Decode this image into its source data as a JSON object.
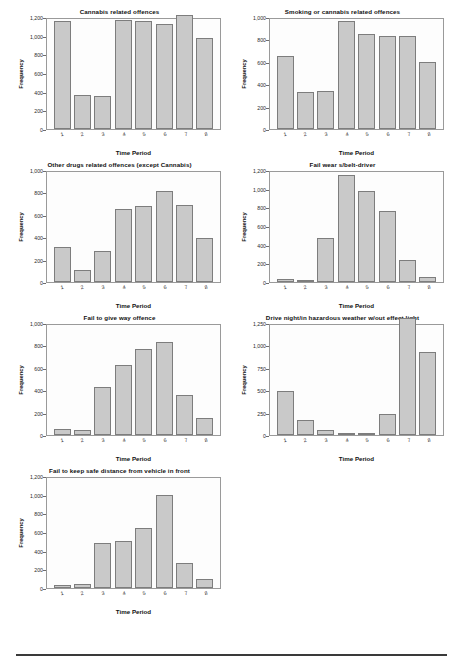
{
  "page": {
    "axis_x_label": "Time Period",
    "axis_y_label": "Frequency",
    "footer_rule_color": "#3a3a3a",
    "bar_fill": "#c9c9c9",
    "bar_stroke": "#7d7d7d"
  },
  "chart_data": [
    {
      "type": "bar",
      "title": "Cannabis related offences",
      "xlabel": "Time Period",
      "ylabel": "Frequency",
      "categories": [
        "1",
        "2",
        "3",
        "4",
        "5",
        "6",
        "7",
        "8"
      ],
      "values": [
        1180,
        370,
        362,
        1192,
        1180,
        1150,
        1240,
        990
      ],
      "ylim": [
        0,
        1200
      ],
      "yticks": [
        0,
        200,
        400,
        600,
        800,
        1000,
        1200
      ],
      "ytick_labels": [
        "0",
        "200",
        "400",
        "600",
        "800",
        "1,000",
        "1,200"
      ],
      "grid": false,
      "legend": "none"
    },
    {
      "type": "bar",
      "title": "Smoking or cannabis related offences",
      "xlabel": "Time Period",
      "ylabel": "Frequency",
      "categories": [
        "1",
        "2",
        "3",
        "4",
        "5",
        "6",
        "7",
        "8"
      ],
      "values": [
        665,
        340,
        345,
        985,
        862,
        845,
        845,
        612
      ],
      "ylim": [
        0,
        1000
      ],
      "yticks": [
        0,
        200,
        400,
        600,
        800,
        1000
      ],
      "ytick_labels": [
        "0",
        "200",
        "400",
        "600",
        "800",
        "1,000"
      ],
      "grid": false,
      "legend": "none"
    },
    {
      "type": "bar",
      "title": "Other drugs related offences (except Cannabis)",
      "xlabel": "Time Period",
      "ylabel": "Frequency",
      "categories": [
        "1",
        "2",
        "3",
        "4",
        "5",
        "6",
        "7",
        "8"
      ],
      "values": [
        320,
        105,
        282,
        665,
        692,
        828,
        700,
        398
      ],
      "ylim": [
        0,
        1000
      ],
      "yticks": [
        0,
        200,
        400,
        600,
        800,
        1000
      ],
      "ytick_labels": [
        "0",
        "200",
        "400",
        "600",
        "800",
        "1,000"
      ],
      "grid": false,
      "legend": "none"
    },
    {
      "type": "bar",
      "title": "Fail wear s/belt-driver",
      "xlabel": "Time Period",
      "ylabel": "Frequency",
      "categories": [
        "1",
        "2",
        "3",
        "4",
        "5",
        "6",
        "7",
        "8"
      ],
      "values": [
        38,
        25,
        478,
        1165,
        998,
        778,
        240,
        50
      ],
      "ylim": [
        0,
        1200
      ],
      "yticks": [
        0,
        200,
        400,
        600,
        800,
        1000,
        1200
      ],
      "ytick_labels": [
        "0",
        "200",
        "400",
        "600",
        "800",
        "1,000",
        "1,200"
      ],
      "grid": false,
      "legend": "none"
    },
    {
      "type": "bar",
      "title": "Fail to give way offence",
      "xlabel": "Time Period",
      "ylabel": "Frequency",
      "categories": [
        "1",
        "2",
        "3",
        "4",
        "5",
        "6",
        "7",
        "8"
      ],
      "values": [
        58,
        50,
        435,
        632,
        785,
        845,
        362,
        152
      ],
      "ylim": [
        0,
        1000
      ],
      "yticks": [
        0,
        200,
        400,
        600,
        800,
        1000
      ],
      "ytick_labels": [
        "0",
        "200",
        "400",
        "600",
        "800",
        "1,000"
      ],
      "grid": false,
      "legend": "none"
    },
    {
      "type": "bar",
      "title": "Drive night/in hazardous weather w/out effect light",
      "xlabel": "Time Period",
      "ylabel": "Frequency",
      "categories": [
        "1",
        "2",
        "3",
        "4",
        "5",
        "6",
        "7",
        "8"
      ],
      "values": [
        505,
        168,
        55,
        28,
        25,
        243,
        1335,
        938
      ],
      "ylim": [
        0,
        1250
      ],
      "yticks": [
        0,
        250,
        500,
        750,
        1000,
        1250
      ],
      "ytick_labels": [
        "0",
        "250",
        "500",
        "750",
        "1,000",
        "1,250"
      ],
      "grid": false,
      "legend": "none"
    },
    {
      "type": "bar",
      "title": "Fail to keep safe distance from vehicle in front",
      "xlabel": "Time Period",
      "ylabel": "Frequency",
      "categories": [
        "1",
        "2",
        "3",
        "4",
        "5",
        "6",
        "7",
        "8"
      ],
      "values": [
        28,
        42,
        492,
        512,
        650,
        1012,
        268,
        98
      ],
      "ylim": [
        0,
        1200
      ],
      "yticks": [
        0,
        200,
        400,
        600,
        800,
        1000,
        1200
      ],
      "ytick_labels": [
        "0",
        "200",
        "400",
        "600",
        "800",
        "1,000",
        "1,200"
      ],
      "grid": false,
      "legend": "none"
    }
  ]
}
